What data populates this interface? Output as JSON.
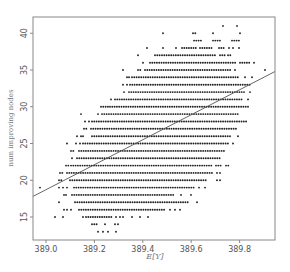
{
  "chart_data": {
    "type": "scatter",
    "title": "",
    "xlabel": "E[Y]",
    "ylabel": "num improving nodes",
    "xlim": [
      388.95,
      389.95
    ],
    "ylim": [
      12.3,
      42.6
    ],
    "x_ticks": [
      "389.0",
      "389.2",
      "389.4",
      "389.6",
      "389.8"
    ],
    "x_tick_values": [
      389.0,
      389.2,
      389.4,
      389.6,
      389.8
    ],
    "y_ticks": [
      "15",
      "20",
      "25",
      "30",
      "35",
      "40"
    ],
    "y_tick_values": [
      15,
      20,
      25,
      30,
      35,
      40
    ],
    "grid": false,
    "legend": null,
    "regression_line": {
      "x": [
        388.95,
        389.95
      ],
      "y": [
        17.8,
        34.8
      ]
    },
    "point_color": "#222222",
    "line_color": "#555555",
    "frame_color": "#888888",
    "rows": [
      {
        "y": 41,
        "x_px": [
          [
            223,
            223
          ],
          [
            237,
            237
          ]
        ]
      },
      {
        "y": 40,
        "x_px": [
          [
            163,
            163
          ],
          [
            193,
            196
          ],
          [
            213,
            213
          ],
          [
            240,
            240
          ]
        ]
      },
      {
        "y": 39,
        "x_px": [
          [
            194,
            203
          ],
          [
            213,
            222
          ],
          [
            232,
            239
          ]
        ]
      },
      {
        "y": 38,
        "x_px": [
          [
            147,
            147
          ],
          [
            163,
            163
          ],
          [
            176,
            178
          ],
          [
            182,
            198
          ],
          [
            200,
            213
          ],
          [
            219,
            225
          ],
          [
            229,
            229
          ],
          [
            233,
            233
          ],
          [
            239,
            239
          ]
        ]
      },
      {
        "y": 37,
        "x_px": [
          [
            138,
            138
          ],
          [
            155,
            160
          ],
          [
            162,
            217
          ],
          [
            220,
            225
          ],
          [
            228,
            232
          ]
        ]
      },
      {
        "y": 36,
        "x_px": [
          [
            143,
            143
          ],
          [
            150,
            236
          ],
          [
            240,
            250
          ],
          [
            254,
            254
          ]
        ]
      },
      {
        "y": 35,
        "x_px": [
          [
            123,
            123
          ],
          [
            138,
            142
          ],
          [
            145,
            232
          ],
          [
            235,
            235
          ],
          [
            265,
            265
          ]
        ]
      },
      {
        "y": 34,
        "x_px": [
          [
            127,
            127
          ],
          [
            129,
            129
          ],
          [
            132,
            240
          ],
          [
            245,
            245
          ],
          [
            252,
            252
          ]
        ]
      },
      {
        "y": 33,
        "x_px": [
          [
            123,
            123
          ],
          [
            127,
            127
          ],
          [
            130,
            250
          ]
        ]
      },
      {
        "y": 32,
        "x_px": [
          [
            124,
            124
          ],
          [
            129,
            245
          ],
          [
            250,
            250
          ]
        ]
      },
      {
        "y": 31,
        "x_px": [
          [
            111,
            112
          ],
          [
            115,
            243
          ],
          [
            248,
            248
          ]
        ]
      },
      {
        "y": 30,
        "x_px": [
          [
            101,
            108
          ],
          [
            110,
            250
          ]
        ]
      },
      {
        "y": 29,
        "x_px": [
          [
            81,
            81
          ],
          [
            98,
            98
          ],
          [
            102,
            240
          ]
        ]
      },
      {
        "y": 28,
        "x_px": [
          [
            85,
            87
          ],
          [
            89,
            89
          ],
          [
            92,
            247
          ]
        ]
      },
      {
        "y": 27,
        "x_px": [
          [
            84,
            88
          ],
          [
            91,
            237
          ]
        ]
      },
      {
        "y": 26,
        "x_px": [
          [
            77,
            77
          ],
          [
            81,
            81
          ],
          [
            83,
            83
          ],
          [
            92,
            232
          ],
          [
            238,
            238
          ]
        ]
      },
      {
        "y": 25,
        "x_px": [
          [
            67,
            67
          ],
          [
            76,
            76
          ],
          [
            80,
            80
          ],
          [
            83,
            230
          ],
          [
            233,
            233
          ]
        ]
      },
      {
        "y": 24,
        "x_px": [
          [
            71,
            75
          ],
          [
            79,
            224
          ]
        ]
      },
      {
        "y": 23,
        "x_px": [
          [
            72,
            74
          ],
          [
            77,
            221
          ]
        ]
      },
      {
        "y": 22,
        "x_px": [
          [
            66,
            69
          ],
          [
            71,
            213
          ],
          [
            216,
            222
          ],
          [
            226,
            230
          ]
        ]
      },
      {
        "y": 21,
        "x_px": [
          [
            60,
            64
          ],
          [
            67,
            213
          ],
          [
            217,
            217
          ],
          [
            220,
            220
          ]
        ]
      },
      {
        "y": 20,
        "x_px": [
          [
            59,
            62
          ],
          [
            70,
            208
          ],
          [
            217,
            217
          ],
          [
            220,
            220
          ]
        ]
      },
      {
        "y": 19,
        "x_px": [
          [
            40,
            40
          ],
          [
            59,
            59
          ],
          [
            63,
            63
          ],
          [
            67,
            67
          ],
          [
            74,
            195
          ],
          [
            199,
            199
          ],
          [
            205,
            205
          ]
        ]
      },
      {
        "y": 18,
        "x_px": [
          [
            64,
            64
          ],
          [
            66,
            66
          ],
          [
            72,
            175
          ],
          [
            181,
            181
          ],
          [
            191,
            191
          ]
        ]
      },
      {
        "y": 17,
        "x_px": [
          [
            59,
            59
          ],
          [
            75,
            190
          ],
          [
            197,
            197
          ]
        ]
      },
      {
        "y": 16,
        "x_px": [
          [
            64,
            64
          ],
          [
            67,
            67
          ],
          [
            71,
            71
          ],
          [
            79,
            165
          ],
          [
            170,
            170
          ],
          [
            175,
            175
          ],
          [
            180,
            180
          ]
        ]
      },
      {
        "y": 15,
        "x_px": [
          [
            55,
            55
          ],
          [
            63,
            63
          ],
          [
            83,
            83
          ],
          [
            86,
            112
          ],
          [
            116,
            116
          ],
          [
            120,
            120
          ],
          [
            123,
            123
          ],
          [
            132,
            132
          ],
          [
            140,
            140
          ],
          [
            148,
            148
          ]
        ]
      },
      {
        "y": 14,
        "x_px": [
          [
            92,
            97
          ],
          [
            105,
            105
          ],
          [
            115,
            115
          ],
          [
            118,
            118
          ]
        ]
      },
      {
        "y": 13,
        "x_px": [
          [
            98,
            98
          ],
          [
            103,
            103
          ],
          [
            108,
            108
          ],
          [
            116,
            118
          ]
        ]
      }
    ]
  }
}
